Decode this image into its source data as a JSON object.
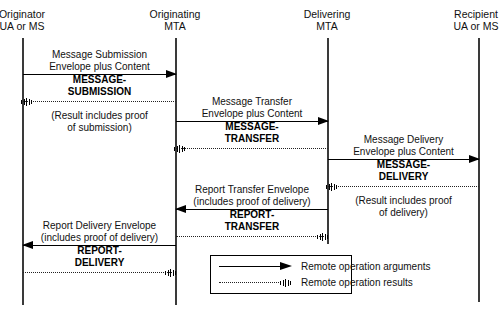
{
  "diagram": {
    "type": "sequence-diagram",
    "title": "",
    "lifelines": [
      {
        "name": "originator",
        "line1": "Originator",
        "line2": "UA or MS",
        "x": 22
      },
      {
        "name": "originating-mta",
        "line1": "Originating",
        "line2": "MTA",
        "x": 175
      },
      {
        "name": "delivering-mta",
        "line1": "Delivering",
        "line2": "MTA",
        "x": 327
      },
      {
        "name": "recipient",
        "line1": "Recipient",
        "line2": "UA or MS",
        "x": 478
      }
    ],
    "messages": [
      {
        "id": "message-submission",
        "argument_label_line1": "Message Submission",
        "argument_label_line2": "Envelope plus Content",
        "operation_line1": "MESSAGE-",
        "operation_line2": "SUBMISSION",
        "note_line1": "(Result includes proof",
        "note_line2": "of submission)",
        "direction": "right"
      },
      {
        "id": "message-transfer",
        "argument_label_line1": "Message Transfer",
        "argument_label_line2": "Envelope plus Content",
        "operation_line1": "MESSAGE-",
        "operation_line2": "TRANSFER",
        "note_line1": "",
        "note_line2": "",
        "direction": "right"
      },
      {
        "id": "message-delivery",
        "argument_label_line1": "Message Delivery",
        "argument_label_line2": "Envelope plus Content",
        "operation_line1": "MESSAGE-",
        "operation_line2": "DELIVERY",
        "note_line1": "(Result includes proof",
        "note_line2": "of delivery)",
        "direction": "right"
      },
      {
        "id": "report-transfer",
        "argument_label_line1": "Report Transfer Envelope",
        "argument_label_line2": "(includes proof of delivery)",
        "operation_line1": "REPORT-",
        "operation_line2": "TRANSFER",
        "note_line1": "",
        "note_line2": "",
        "direction": "left"
      },
      {
        "id": "report-delivery",
        "argument_label_line1": "Report Delivery Envelope",
        "argument_label_line2": "(includes proof of delivery)",
        "operation_line1": "REPORT-",
        "operation_line2": "DELIVERY",
        "note_line1": "",
        "note_line2": "",
        "direction": "left"
      }
    ],
    "legend": {
      "arguments_label": "Remote operation arguments",
      "results_label": "Remote operation results"
    },
    "colors": {
      "line": "#000000",
      "lifeline": "#3a3a3a",
      "text": "#111111",
      "background": "#ffffff"
    }
  }
}
